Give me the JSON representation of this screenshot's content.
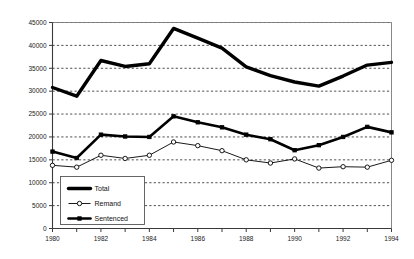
{
  "chart_data": {
    "type": "line",
    "title": "",
    "subtitle": "",
    "xlabel": "",
    "ylabel": "",
    "x": [
      1980,
      1981,
      1982,
      1983,
      1984,
      1985,
      1986,
      1987,
      1988,
      1989,
      1990,
      1991,
      1992,
      1993,
      1994
    ],
    "categories": [
      "1980",
      "1981",
      "1982",
      "1983",
      "1984",
      "1985",
      "1986",
      "1987",
      "1988",
      "1989",
      "1990",
      "1991",
      "1992",
      "1993",
      "1994"
    ],
    "xlim": [
      1980,
      1994
    ],
    "ylim": [
      0,
      45000
    ],
    "xtick_labels": [
      "1980",
      "1982",
      "1984",
      "1986",
      "1988",
      "1990",
      "1992",
      "1994"
    ],
    "xtick_values": [
      1980,
      1982,
      1984,
      1986,
      1988,
      1990,
      1992,
      1994
    ],
    "ytick_labels": [
      "0",
      "5000",
      "10000",
      "15000",
      "20000",
      "25000",
      "30000",
      "35000",
      "40000",
      "45000"
    ],
    "ytick_values": [
      0,
      5000,
      10000,
      15000,
      20000,
      25000,
      30000,
      35000,
      40000,
      45000
    ],
    "grid": true,
    "grid_axis": "y",
    "grid_style": "dotted",
    "legend_position": "lower-left-inside",
    "series": [
      {
        "name": "Total",
        "style": "thick-line",
        "marker": "none",
        "color": "#000000",
        "values": [
          30800,
          28900,
          36700,
          35400,
          36000,
          43700,
          41600,
          39400,
          35300,
          33400,
          32000,
          31100,
          33300,
          35700,
          36300
        ]
      },
      {
        "name": "Remand",
        "style": "thin-line",
        "marker": "open-circle",
        "color": "#000000",
        "values": [
          13800,
          13400,
          16000,
          15300,
          16000,
          18900,
          18100,
          17000,
          15000,
          14300,
          15200,
          13200,
          13500,
          13400,
          14900
        ]
      },
      {
        "name": "Sentenced",
        "style": "thick-line",
        "marker": "filled-square",
        "color": "#000000",
        "values": [
          16800,
          15400,
          20500,
          20100,
          20000,
          24500,
          23200,
          22100,
          20500,
          19500,
          17100,
          18200,
          20000,
          22200,
          21000
        ]
      }
    ]
  },
  "legend": {
    "items": [
      {
        "label": "Total"
      },
      {
        "label": "Remand"
      },
      {
        "label": "Sentenced"
      }
    ]
  }
}
